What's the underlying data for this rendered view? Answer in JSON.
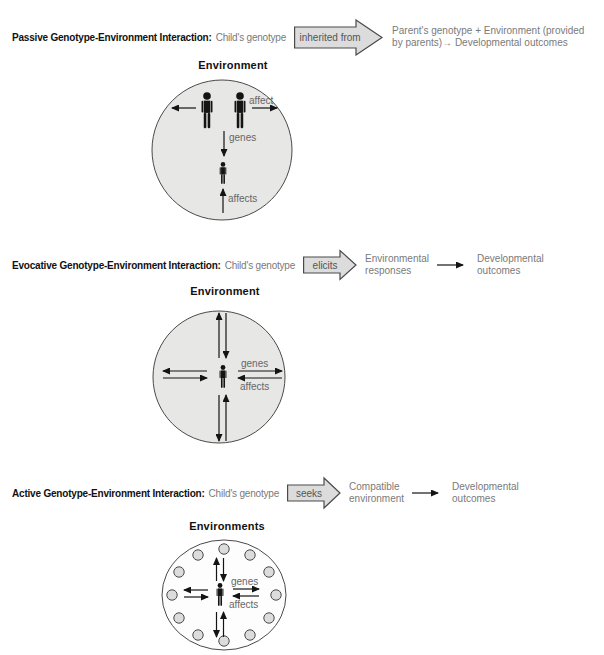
{
  "figure_title": "Genotype-Environment Interactions",
  "colors": {
    "ink": "#111111",
    "muted_text": "#7a7a7a",
    "circle_fill": "#e7e7e5",
    "open_circle_fill": "#fdfdfd",
    "block_arrow_fill": "#dcdcdc",
    "outline": "#4a4a4a",
    "figure_black": "#141414"
  },
  "sections": [
    {
      "heading_bold": "Passive Genotype-Environment Interaction:",
      "heading_rest": "Child's genotype",
      "block_arrow_label": "inherited from",
      "result_line1": "Parent's genotype + Environment (provided",
      "result_line2": "by parents)→ Developmental outcomes",
      "env_label": "Environment",
      "labels": {
        "affect": "affect",
        "genes": "genes",
        "affects": "affects"
      }
    },
    {
      "heading_bold": "Evocative Genotype-Environment Interaction:",
      "heading_rest": "Child's genotype",
      "block_arrow_label": "elicits",
      "mid_line1": "Environmental",
      "mid_line2": "responses",
      "result_line1": "Developmental",
      "result_line2": "outcomes",
      "env_label": "Environment",
      "labels": {
        "genes": "genes",
        "affects": "affects"
      }
    },
    {
      "heading_bold": "Active Genotype-Environment Interaction:",
      "heading_rest": "Child's genotype",
      "block_arrow_label": "seeks",
      "mid_line1": "Compatible",
      "mid_line2": "environment",
      "result_line1": "Developmental",
      "result_line2": "outcomes",
      "env_label": "Environments",
      "labels": {
        "genes": "genes",
        "affects": "affects"
      }
    }
  ]
}
